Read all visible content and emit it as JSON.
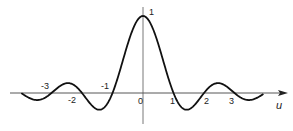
{
  "chart_data": {
    "type": "line",
    "title": "",
    "function": "sinc(u) = sin(pi*u)/(pi*u)",
    "xlabel": "u",
    "ylabel": "",
    "xlim": [
      -3.97,
      3.93
    ],
    "ylim": [
      -0.25,
      1.0
    ],
    "grid": false,
    "legend": null,
    "tick_labels": {
      "peak": "1",
      "zeros_negative": [
        "-3",
        "-2",
        "-1"
      ],
      "origin": "0",
      "zeros_positive": [
        "1",
        "2",
        "3"
      ]
    },
    "annotations": [
      {
        "text": "1",
        "at": [
          0,
          1.0
        ]
      },
      {
        "text": "-1",
        "at": [
          -1,
          0
        ]
      },
      {
        "text": "-2",
        "at": [
          -2,
          0
        ]
      },
      {
        "text": "-3",
        "at": [
          -3,
          0
        ]
      },
      {
        "text": "0",
        "at": [
          0,
          0
        ]
      },
      {
        "text": "1",
        "at": [
          1,
          0
        ]
      },
      {
        "text": "2",
        "at": [
          2,
          0
        ]
      },
      {
        "text": "3",
        "at": [
          3,
          0
        ]
      }
    ],
    "x": [
      -3.9,
      -3.5,
      -3,
      -2.5,
      -2,
      -1.5,
      -1,
      -0.5,
      0,
      0.5,
      1,
      1.5,
      2,
      2.5,
      3,
      3.5,
      3.9
    ],
    "values": [
      -0.025,
      -0.091,
      0,
      0.127,
      0,
      -0.212,
      0,
      0.637,
      1.0,
      0.637,
      0,
      -0.212,
      0,
      0.127,
      0,
      -0.091,
      -0.025
    ]
  },
  "labels": {
    "peak": "1",
    "neg3": "-3",
    "neg2": "-2",
    "neg1": "-1",
    "zero": "0",
    "pos1": "1",
    "pos2": "2",
    "pos3": "3",
    "axis": "u"
  }
}
